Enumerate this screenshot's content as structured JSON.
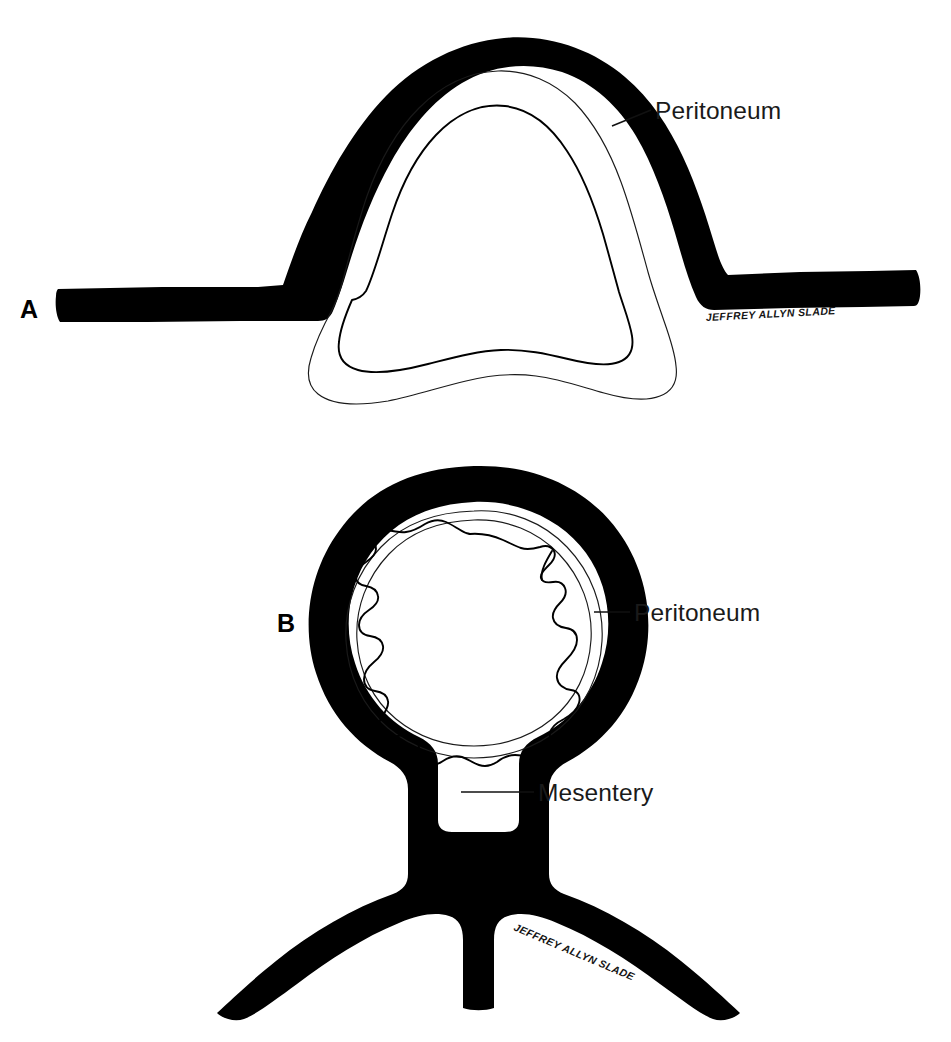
{
  "figure": {
    "background_color": "#ffffff",
    "ink_color": "#000000",
    "line_color": "#1a1a1a",
    "width": 951,
    "height": 1042
  },
  "panels": [
    {
      "id": "A",
      "letter": "A",
      "description": "Retroperitoneal / sessile organ covered anteriorly by peritoneum, shown in cross-section with the peritoneal band sweeping up and over the dome-shaped viscus",
      "callouts": [
        {
          "id": "peritoneum-a",
          "label": "Peritoneum",
          "leader_from_x": 612,
          "leader_from_y": 126,
          "leader_to_x": 651,
          "leader_to_y": 110,
          "text_x": 655,
          "text_y": 119
        }
      ],
      "signature": {
        "text": "JEFFREY ALLYN SLADE",
        "x": 706,
        "y": 321,
        "rotation": -3
      },
      "letter_position": {
        "x": 20,
        "y": 318
      }
    },
    {
      "id": "B",
      "letter": "B",
      "description": "Intraperitoneal organ completely invested by peritoneum and suspended by a double-layered mesentery that descends to the posterior body wall",
      "callouts": [
        {
          "id": "peritoneum-b",
          "label": "Peritoneum",
          "leader_from_x": 594,
          "leader_from_y": 612,
          "leader_to_x": 630,
          "leader_to_y": 612,
          "text_x": 634,
          "text_y": 621
        },
        {
          "id": "mesentery-b",
          "label": "Mesentery",
          "leader_from_x": 461,
          "leader_from_y": 792,
          "leader_to_x": 534,
          "leader_to_y": 792,
          "text_x": 538,
          "text_y": 801
        }
      ],
      "signature": {
        "text": "JEFFREY ALLYN SLADE",
        "x": 513,
        "y": 930,
        "rotation": 23
      },
      "letter_position": {
        "x": 277,
        "y": 632
      }
    }
  ],
  "labels": {
    "peritoneum": "Peritoneum",
    "mesentery": "Mesentery",
    "panel_a": "A",
    "panel_b": "B",
    "signature": "JEFFREY ALLYN SLADE"
  }
}
